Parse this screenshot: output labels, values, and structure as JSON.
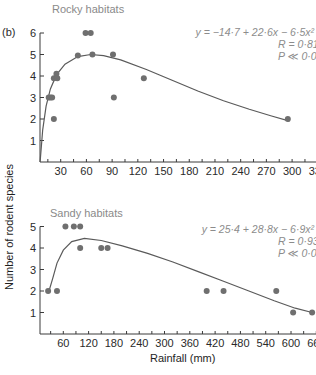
{
  "figure": {
    "panel_label": "(b)",
    "ylabel": "Number of rodent species",
    "xlabel": "Rainfall (mm)"
  },
  "chart_data": [
    {
      "type": "scatter",
      "title": "Rocky habitats",
      "xlabel": "Rainfall (mm)",
      "ylabel": "Number of rodent species",
      "xlim": [
        0,
        330
      ],
      "ylim": [
        0,
        6
      ],
      "xticks": [
        30,
        60,
        90,
        120,
        150,
        180,
        210,
        240,
        270,
        300,
        330
      ],
      "yticks": [
        1,
        2,
        3,
        4,
        5,
        6
      ],
      "grid": false,
      "points": [
        {
          "x": 16,
          "y": 3
        },
        {
          "x": 18,
          "y": 3
        },
        {
          "x": 20,
          "y": 3
        },
        {
          "x": 22,
          "y": 3.9
        },
        {
          "x": 25,
          "y": 4.1
        },
        {
          "x": 26,
          "y": 3.9
        },
        {
          "x": 22,
          "y": 2
        },
        {
          "x": 50,
          "y": 4.95
        },
        {
          "x": 59,
          "y": 6
        },
        {
          "x": 65,
          "y": 6
        },
        {
          "x": 67,
          "y": 5
        },
        {
          "x": 91,
          "y": 5
        },
        {
          "x": 92,
          "y": 3
        },
        {
          "x": 127,
          "y": 3.9
        },
        {
          "x": 295,
          "y": 2
        }
      ],
      "fit_curve": [
        [
          6,
          0
        ],
        [
          9,
          1.5
        ],
        [
          13,
          2.6
        ],
        [
          18,
          3.4
        ],
        [
          25,
          4.05
        ],
        [
          35,
          4.55
        ],
        [
          50,
          4.9
        ],
        [
          65,
          5.0
        ],
        [
          80,
          4.95
        ],
        [
          100,
          4.75
        ],
        [
          130,
          4.3
        ],
        [
          160,
          3.8
        ],
        [
          190,
          3.3
        ],
        [
          220,
          2.85
        ],
        [
          250,
          2.45
        ],
        [
          275,
          2.15
        ],
        [
          297,
          1.9
        ]
      ],
      "equation": "y = −14·7 + 22·6x − 6·5x²",
      "r_text": "R = 0·81",
      "p_text": "P ≪ 0·01"
    },
    {
      "type": "scatter",
      "title": "Sandy habitats",
      "xlabel": "Rainfall (mm)",
      "ylabel": "Number of rodent species",
      "xlim": [
        0,
        660
      ],
      "ylim": [
        0,
        5
      ],
      "xticks": [
        60,
        120,
        180,
        240,
        300,
        360,
        420,
        480,
        540,
        600,
        660
      ],
      "yticks": [
        1,
        2,
        3,
        4,
        5
      ],
      "grid": false,
      "points": [
        {
          "x": 24,
          "y": 2
        },
        {
          "x": 45,
          "y": 2
        },
        {
          "x": 65,
          "y": 5
        },
        {
          "x": 85,
          "y": 5
        },
        {
          "x": 100,
          "y": 5
        },
        {
          "x": 100,
          "y": 4
        },
        {
          "x": 150,
          "y": 4
        },
        {
          "x": 165,
          "y": 4
        },
        {
          "x": 400,
          "y": 2
        },
        {
          "x": 440,
          "y": 2
        },
        {
          "x": 565,
          "y": 2
        },
        {
          "x": 605,
          "y": 1
        },
        {
          "x": 650,
          "y": 1
        }
      ],
      "fit_curve": [
        [
          26,
          2.0
        ],
        [
          35,
          2.6
        ],
        [
          45,
          3.3
        ],
        [
          60,
          3.9
        ],
        [
          80,
          4.3
        ],
        [
          110,
          4.45
        ],
        [
          150,
          4.35
        ],
        [
          200,
          4.1
        ],
        [
          260,
          3.75
        ],
        [
          320,
          3.35
        ],
        [
          380,
          2.9
        ],
        [
          440,
          2.45
        ],
        [
          500,
          2.0
        ],
        [
          560,
          1.55
        ],
        [
          610,
          1.2
        ],
        [
          650,
          1.0
        ]
      ],
      "equation": "y = 25·4 + 28·8x − 6·9x²",
      "r_text": "R = 0·93",
      "p_text": "P ≪ 0·01"
    }
  ],
  "layout": {
    "panels": [
      {
        "x0px": 35,
        "xscale": 0.857,
        "baseline": 162,
        "yscale": 21.5,
        "axis_x": 40,
        "axis_right": 318,
        "title_pos": [
          52,
          13
        ],
        "eq_pos": [
          314,
          36
        ],
        "r_pos": [
          278,
          48
        ],
        "p_pos": [
          278,
          60
        ],
        "tick_label_y": 175
      },
      {
        "x0px": 38,
        "xscale": 0.4217,
        "baseline": 334,
        "yscale": 21.5,
        "axis_x": 40,
        "axis_right": 316,
        "title_pos": [
          50,
          217
        ],
        "eq_pos": [
          314,
          233
        ],
        "r_pos": [
          278,
          245
        ],
        "p_pos": [
          278,
          257
        ],
        "tick_label_y": 347
      }
    ]
  }
}
